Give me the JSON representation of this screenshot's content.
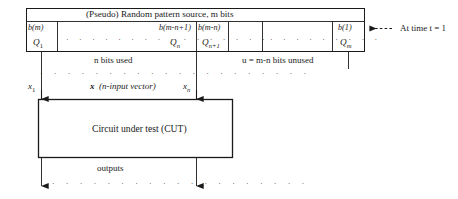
{
  "diagram": {
    "register": {
      "header": "(Pseudo) Random pattern source, m bits",
      "header_italic_var": "m",
      "cells": [
        {
          "bit": "b(m)",
          "stage": "Q",
          "stage_sub": "1"
        },
        {
          "bit": "b(m-n+1)",
          "stage": "Q",
          "stage_sub": "n"
        },
        {
          "bit": "b(m-n)",
          "stage": "Q",
          "stage_sub": "n+1"
        },
        {
          "bit": "b(1)",
          "stage": "Q",
          "stage_sub": "m"
        }
      ],
      "ellipsis_left": "· · · · · · · · · · · · · · · ·",
      "ellipsis_right": "· · · · · · · · ·"
    },
    "annotations": {
      "time": "At time t = 1",
      "time_var": "t",
      "used": "n bits used",
      "used_var": "n",
      "unused": "u = m-n bits unused",
      "unused_vars": "u = m-n"
    },
    "vector": {
      "first_input": "x",
      "first_input_sub": "1",
      "last_input": "x",
      "last_input_sub": "n",
      "name": "x",
      "description": "(n-input vector)",
      "ellipsis": "· · · · · · · · · · · · · · · · · · · ·"
    },
    "cut": {
      "label": "Circuit under test (CUT)"
    },
    "outputs": {
      "label": "outputs",
      "ellipsis": "· · · · · · · · · · · · · · · · · · ·"
    },
    "colors": {
      "line": "#1a1a1a",
      "background": "#ffffff",
      "text": "#1a1a1a"
    }
  }
}
